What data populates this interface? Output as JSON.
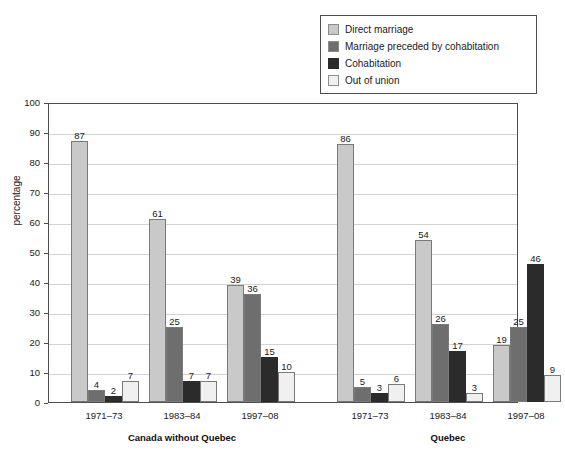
{
  "chart_data": {
    "type": "bar",
    "title": "",
    "xlabel": "",
    "ylabel": "percentage",
    "ylim": [
      0,
      100
    ],
    "ytick_step": 10,
    "yticks": [
      0,
      10,
      20,
      30,
      40,
      50,
      60,
      70,
      80,
      90,
      100
    ],
    "grid": true,
    "legend_position": "top-right",
    "categories": [
      "1971–73",
      "1983–84",
      "1997–08",
      "1971–73",
      "1983–84",
      "1997–08"
    ],
    "groups": [
      {
        "label": "Canada without Quebec",
        "periods": [
          "1971–73",
          "1983–84",
          "1997–08"
        ]
      },
      {
        "label": "Quebec",
        "periods": [
          "1971–73",
          "1983–84",
          "1997–08"
        ]
      }
    ],
    "series": [
      {
        "name": "Direct marriage",
        "color": "#c9c9c9",
        "values": [
          87,
          61,
          39,
          86,
          54,
          19
        ]
      },
      {
        "name": "Marriage preceded by cohabitation",
        "color": "#6e6e6e",
        "values": [
          4,
          25,
          36,
          5,
          26,
          25
        ]
      },
      {
        "name": "Cohabitation",
        "color": "#2b2b2b",
        "values": [
          2,
          7,
          15,
          3,
          17,
          46
        ]
      },
      {
        "name": "Out of union",
        "color": "#f0f0f0",
        "values": [
          7,
          7,
          10,
          6,
          3,
          9
        ]
      }
    ]
  },
  "legend": {
    "items": [
      {
        "label": "Direct marriage",
        "color": "#c9c9c9"
      },
      {
        "label": "Marriage preceded by cohabitation",
        "color": "#6e6e6e"
      },
      {
        "label": "Cohabitation",
        "color": "#2b2b2b"
      },
      {
        "label": "Out of union",
        "color": "#f0f0f0"
      }
    ]
  },
  "axis": {
    "y_title": "percentage",
    "y_labels": [
      "100",
      "90",
      "80",
      "70",
      "60",
      "50",
      "40",
      "30",
      "20",
      "10",
      "0"
    ]
  }
}
